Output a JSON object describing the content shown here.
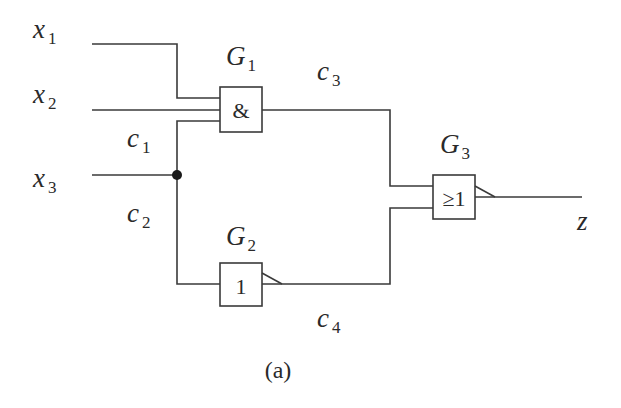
{
  "diagram": {
    "type": "logic-circuit",
    "caption": "(a)",
    "inputs": [
      {
        "name": "x",
        "sub": "1"
      },
      {
        "name": "x",
        "sub": "2"
      },
      {
        "name": "x",
        "sub": "3"
      }
    ],
    "output": {
      "name": "z"
    },
    "wires": [
      {
        "name": "c",
        "sub": "1"
      },
      {
        "name": "c",
        "sub": "2"
      },
      {
        "name": "c",
        "sub": "3"
      },
      {
        "name": "c",
        "sub": "4"
      }
    ],
    "gates": [
      {
        "id": "G1",
        "name": "G",
        "sub": "1",
        "symbol": "&",
        "function": "AND",
        "inputs": [
          "x1",
          "x2",
          "c1"
        ],
        "output": "c3"
      },
      {
        "id": "G2",
        "name": "G",
        "sub": "2",
        "symbol": "1",
        "function": "NOT",
        "inputs": [
          "c2"
        ],
        "output": "c4"
      },
      {
        "id": "G3",
        "name": "G",
        "sub": "3",
        "symbol": "≥1",
        "function": "NOR",
        "inputs": [
          "c3",
          "c4"
        ],
        "output": "z"
      }
    ],
    "fanout": {
      "source": "x3",
      "branches": [
        "c1",
        "c2"
      ]
    }
  }
}
